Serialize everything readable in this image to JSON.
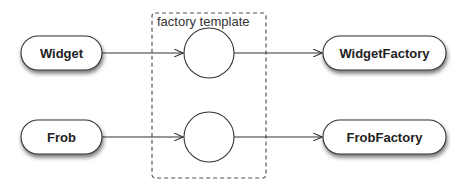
{
  "diagram": {
    "template_box": {
      "label": "factory template"
    },
    "rows": [
      {
        "source": "Widget",
        "target": "WidgetFactory"
      },
      {
        "source": "Frob",
        "target": "FrobFactory"
      }
    ]
  },
  "colors": {
    "stroke": "#333333",
    "dashed": "#555555",
    "fill": "#ffffff",
    "shadow": "#888888"
  }
}
